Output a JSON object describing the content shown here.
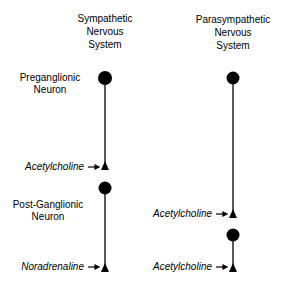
{
  "columns": {
    "sympathetic": {
      "title_lines": [
        "Sympathetic",
        "Nervous",
        "System"
      ]
    },
    "parasympathetic": {
      "title_lines": [
        "Parasympathetic",
        "Nervous",
        "System"
      ]
    }
  },
  "row_labels": {
    "preganglionic": [
      "Preganglionic",
      "Neuron"
    ],
    "postganglionic": [
      "Post-Ganglionic",
      "Neuron"
    ]
  },
  "neurotransmitters": {
    "symp_pre": "Acetylcholine",
    "symp_post": "Noradrenaline",
    "para_pre": "Acetylcholine",
    "para_post": "Acetylcholine"
  },
  "arrow_glyph": "→",
  "colors": {
    "ink": "#000000",
    "background": "#ffffff"
  }
}
